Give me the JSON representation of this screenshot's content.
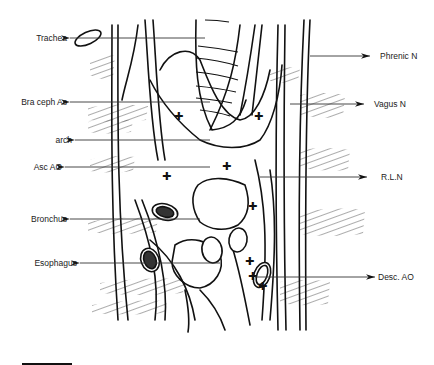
{
  "figure": {
    "type": "anatomical line drawing",
    "left_labels": [
      {
        "id": "trachea",
        "text": "Trachea",
        "y": 38
      },
      {
        "id": "bra-ceph",
        "text": "Bra ceph As",
        "y": 102
      },
      {
        "id": "arch",
        "text": "arch",
        "y": 140
      },
      {
        "id": "asc-ao",
        "text": "Asc AO",
        "y": 167
      },
      {
        "id": "bronchus",
        "text": "Bronchus",
        "y": 219
      },
      {
        "id": "esophagus",
        "text": "Esophagus",
        "y": 263
      }
    ],
    "right_labels": [
      {
        "id": "phrenic",
        "text": "Phrenic N",
        "y": 56
      },
      {
        "id": "vagus",
        "text": "Vagus N",
        "y": 104
      },
      {
        "id": "rln",
        "text": "R.L.N",
        "y": 177
      },
      {
        "id": "desc-ao",
        "text": "Desc. AO",
        "y": 277
      }
    ],
    "scale_bar": {
      "label": ""
    }
  }
}
